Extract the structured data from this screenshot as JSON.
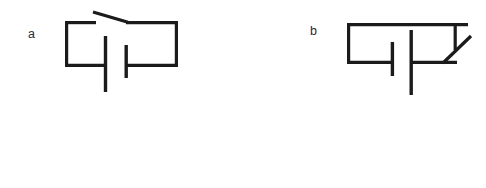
{
  "figure": {
    "background_color": "#ffffff",
    "line_color": "#1b1b1b",
    "label_color": "#2a2a2a",
    "width": 486,
    "height": 188
  },
  "panels": [
    {
      "id": "a",
      "label": "a",
      "label_x": 28,
      "label_y": 38,
      "switch_state": "open",
      "description": "Rectangular circuit loop with an open knife switch in the top wire and a battery cell in the middle branch",
      "loop": {
        "left_x": 65,
        "right_x": 178,
        "top_y": 21,
        "bottom_y": 67
      },
      "switch": {
        "name": "open-switch",
        "hinge_x": 93,
        "hinge_y": 12,
        "contact_x": 128,
        "contact_y": 22,
        "top_wire_left_end_x": 95,
        "top_wire_right_start_x": 128
      },
      "battery": {
        "name": "battery-cell",
        "long_plate_x": 105,
        "long_plate_y1": 36,
        "long_plate_y2": 92,
        "short_plate_x": 126,
        "short_plate_y1": 45,
        "short_plate_y2": 78,
        "polarity": "long plate on left, short plate on right"
      }
    },
    {
      "id": "b",
      "label": "b",
      "label_x": 310,
      "label_y": 35,
      "switch_state": "closed",
      "description": "Rectangular circuit loop with a closed knife switch on the right side and a battery cell in the middle branch",
      "loop": {
        "left_x": 347,
        "right_x": 468,
        "top_y": 23,
        "bottom_y": 64
      },
      "switch": {
        "name": "closed-switch",
        "contact_drop_x": 455,
        "contact_drop_y1": 23,
        "contact_drop_y2": 50,
        "arm_x1": 443,
        "arm_y1": 63,
        "arm_x2": 471,
        "arm_y2": 36
      },
      "battery": {
        "name": "battery-cell",
        "short_plate_x": 392,
        "short_plate_y1": 42,
        "short_plate_y2": 76,
        "long_plate_x": 411,
        "long_plate_y1": 30,
        "long_plate_y2": 95,
        "polarity": "short plate on left, long plate on right"
      }
    }
  ]
}
